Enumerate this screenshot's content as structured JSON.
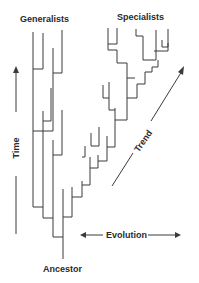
{
  "labels": {
    "generalists": "Generalists",
    "specialists": "Specialists",
    "ancestor": "Ancestor",
    "time": "Time",
    "trend": "Trend",
    "evolution": "Evolution"
  },
  "axes": {
    "time": {
      "label": "Time",
      "direction": "up",
      "orientation": "vertical"
    },
    "evolution": {
      "label": "Evolution",
      "direction": "both",
      "orientation": "horizontal"
    },
    "trend": {
      "label": "Trend",
      "direction": "up-right",
      "orientation": "diagonal"
    }
  },
  "groups": [
    {
      "name": "Generalists",
      "position": "top-left",
      "description": "Branches that continue upward with little lateral change"
    },
    {
      "name": "Specialists",
      "position": "top-right",
      "description": "Branches that step diagonally away from ancestor"
    }
  ],
  "root": {
    "name": "Ancestor",
    "position": "bottom-center"
  },
  "colors": {
    "line": "#3a3a3a",
    "text": "#2a2a2a",
    "background": "#ffffff"
  }
}
